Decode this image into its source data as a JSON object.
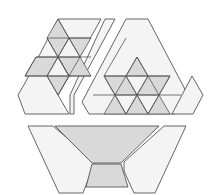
{
  "diagram": {
    "colors": {
      "background": "#ffffff",
      "piece_fill": "#f4f4f4",
      "shaded_fill": "#d9d9d9",
      "stroke": "#555555"
    },
    "pieces": [
      {
        "name": "top-left-piece",
        "fill": "piece_fill",
        "points": [
          [
            58,
            19
          ],
          [
            101,
            19
          ],
          [
            69,
            76
          ],
          [
            69,
            76
          ],
          [
            58,
            95
          ],
          [
            69,
            114
          ],
          [
            25,
            114
          ],
          [
            18,
            95
          ],
          [
            25,
            83
          ]
        ]
      },
      {
        "name": "top-middle-slanted-strip",
        "fill": "piece_fill",
        "points": [
          [
            105,
            19
          ],
          [
            115,
            19
          ],
          [
            74,
            95
          ],
          [
            74,
            114
          ],
          [
            70,
            114
          ],
          [
            70,
            95
          ]
        ]
      },
      {
        "name": "top-right-triangle-piece",
        "fill": "piece_fill",
        "points": [
          [
            126,
            19
          ],
          [
            148,
            19
          ],
          [
            188,
            95
          ],
          [
            175,
            114
          ],
          [
            89,
            114
          ],
          [
            82,
            102
          ]
        ]
      },
      {
        "name": "small-right-rhombus-piece",
        "fill": "piece_fill",
        "points": [
          [
            192,
            76
          ],
          [
            203,
            95
          ],
          [
            193,
            114
          ],
          [
            172,
            114
          ]
        ]
      },
      {
        "name": "bottom-left-piece",
        "fill": "piece_fill",
        "points": [
          [
            28,
            126
          ],
          [
            53,
            126
          ],
          [
            95,
            162
          ],
          [
            83,
            193
          ],
          [
            59,
            193
          ]
        ]
      },
      {
        "name": "bottom-trapezoid-large",
        "fill": "shaded_fill",
        "points": [
          [
            55,
            126
          ],
          [
            159,
            126
          ],
          [
            121,
            163
          ],
          [
            92,
            163
          ]
        ]
      },
      {
        "name": "bottom-trapezoid-small",
        "fill": "shaded_fill",
        "points": [
          [
            92,
            164
          ],
          [
            121,
            164
          ],
          [
            128,
            187
          ],
          [
            86,
            187
          ]
        ]
      },
      {
        "name": "bottom-right-piece",
        "fill": "piece_fill",
        "points": [
          [
            164,
            126
          ],
          [
            186,
            126
          ],
          [
            155,
            193
          ],
          [
            134,
            193
          ],
          [
            124,
            171
          ],
          [
            124,
            162
          ]
        ]
      }
    ],
    "shaded_tiles_left": [
      {
        "name": "rhombus-top",
        "points": [
          [
            58,
            19
          ],
          [
            69,
            38
          ],
          [
            58,
            57
          ],
          [
            47,
            38
          ]
        ]
      },
      {
        "name": "triangle-right-upper",
        "points": [
          [
            69,
            38
          ],
          [
            91,
            38
          ],
          [
            80,
            57
          ]
        ]
      },
      {
        "name": "rhombus-left-mid",
        "points": [
          [
            36,
            57
          ],
          [
            58,
            57
          ],
          [
            47,
            76
          ],
          [
            25,
            76
          ]
        ]
      },
      {
        "name": "rhombus-right-mid",
        "points": [
          [
            58,
            57
          ],
          [
            80,
            57
          ],
          [
            91,
            76
          ],
          [
            69,
            76
          ]
        ]
      },
      {
        "name": "rhombus-bottom",
        "points": [
          [
            47,
            76
          ],
          [
            69,
            76
          ],
          [
            58,
            95
          ]
        ]
      }
    ],
    "grid_lines_left": [
      [
        [
          47,
          38
        ],
        [
          91,
          38
        ]
      ],
      [
        [
          36,
          57
        ],
        [
          91,
          57
        ]
      ],
      [
        [
          25,
          76
        ],
        [
          91,
          76
        ]
      ],
      [
        [
          58,
          19
        ],
        [
          80,
          57
        ]
      ],
      [
        [
          47,
          38
        ],
        [
          69,
          76
        ]
      ],
      [
        [
          69,
          38
        ],
        [
          58,
          57
        ]
      ],
      [
        [
          58,
          57
        ],
        [
          47,
          76
        ]
      ],
      [
        [
          58,
          57
        ],
        [
          69,
          76
        ]
      ],
      [
        [
          80,
          57
        ],
        [
          69,
          76
        ]
      ],
      [
        [
          47,
          76
        ],
        [
          58,
          95
        ]
      ],
      [
        [
          69,
          76
        ],
        [
          58,
          95
        ]
      ],
      [
        [
          36,
          57
        ],
        [
          25,
          76
        ]
      ]
    ],
    "shaded_tiles_right": [
      {
        "name": "triangle-top",
        "points": [
          [
            137,
            57
          ],
          [
            148,
            76
          ],
          [
            126,
            76
          ]
        ]
      },
      {
        "name": "rhombus-left",
        "points": [
          [
            104,
            76
          ],
          [
            126,
            76
          ],
          [
            137,
            95
          ],
          [
            115,
            95
          ]
        ]
      },
      {
        "name": "rhombus-right",
        "points": [
          [
            148,
            76
          ],
          [
            170,
            76
          ],
          [
            159,
            95
          ],
          [
            137,
            95
          ]
        ]
      },
      {
        "name": "triangle-left-low",
        "points": [
          [
            115,
            95
          ],
          [
            126,
            114
          ],
          [
            104,
            114
          ]
        ]
      },
      {
        "name": "rhombus-bottom",
        "points": [
          [
            137,
            95
          ],
          [
            148,
            114
          ],
          [
            137,
            114
          ],
          [
            126,
            114
          ]
        ]
      },
      {
        "name": "triangle-right-low",
        "points": [
          [
            159,
            95
          ],
          [
            170,
            114
          ],
          [
            148,
            114
          ]
        ]
      }
    ],
    "grid_lines_right": [
      [
        [
          104,
          76
        ],
        [
          170,
          76
        ]
      ],
      [
        [
          93,
          95
        ],
        [
          181,
          95
        ]
      ],
      [
        [
          137,
          57
        ],
        [
          115,
          95
        ]
      ],
      [
        [
          137,
          57
        ],
        [
          159,
          95
        ]
      ],
      [
        [
          126,
          76
        ],
        [
          137,
          95
        ]
      ],
      [
        [
          148,
          76
        ],
        [
          137,
          95
        ]
      ],
      [
        [
          115,
          95
        ],
        [
          126,
          114
        ]
      ],
      [
        [
          159,
          95
        ],
        [
          148,
          114
        ]
      ],
      [
        [
          137,
          95
        ],
        [
          126,
          114
        ]
      ],
      [
        [
          137,
          95
        ],
        [
          148,
          114
        ]
      ],
      [
        [
          104,
          76
        ],
        [
          115,
          95
        ]
      ],
      [
        [
          170,
          76
        ],
        [
          159,
          95
        ]
      ],
      [
        [
          126,
          38
        ],
        [
          104,
          76
        ]
      ]
    ]
  }
}
